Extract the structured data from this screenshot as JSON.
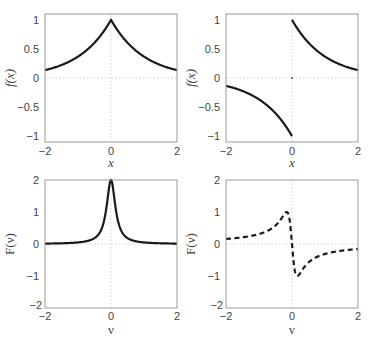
{
  "chart_data": [
    {
      "type": "line",
      "panel": "top-left",
      "title": "",
      "xlabel": "x",
      "ylabel": "f(x)",
      "xlim": [
        -2,
        2
      ],
      "ylim": [
        -1.1,
        1.1
      ],
      "xticks": [
        "-2",
        "0",
        "2"
      ],
      "yticks": [
        "-1",
        "-0.5",
        "0",
        "0.5",
        "1"
      ],
      "grid": "zero lines only (dotted)",
      "series": [
        {
          "name": "f(x) = e^{-|x|}",
          "style": "solid",
          "x": [
            -2,
            -1.5,
            -1,
            -0.5,
            0,
            0.5,
            1,
            1.5,
            2
          ],
          "y": [
            0.135,
            0.223,
            0.368,
            0.607,
            1.0,
            0.607,
            0.368,
            0.223,
            0.135
          ]
        }
      ]
    },
    {
      "type": "line",
      "panel": "top-right",
      "title": "",
      "xlabel": "x",
      "ylabel": "f(x)",
      "xlim": [
        -2,
        2
      ],
      "ylim": [
        -1.1,
        1.1
      ],
      "xticks": [
        "-2",
        "0",
        "2"
      ],
      "yticks": [
        "-1",
        "-0.5",
        "0",
        "0.5",
        "1"
      ],
      "grid": "zero lines only (dotted)",
      "series": [
        {
          "name": "f(x) = sgn(x) e^{-|x|}",
          "style": "solid",
          "x": [
            -2,
            -1.5,
            -1,
            -0.5,
            0,
            0,
            0.5,
            1,
            1.5,
            2
          ],
          "y": [
            -0.135,
            -0.223,
            -0.368,
            -0.607,
            -1.0,
            1.0,
            0.607,
            0.368,
            0.223,
            0.135
          ]
        }
      ]
    },
    {
      "type": "line",
      "panel": "bottom-left",
      "title": "",
      "xlabel": "ν",
      "ylabel": "F(ν)",
      "xlim": [
        -2,
        2
      ],
      "ylim": [
        -2,
        2
      ],
      "xticks": [
        "-2",
        "0",
        "2"
      ],
      "yticks": [
        "-2",
        "-1",
        "0",
        "1",
        "2"
      ],
      "grid": "zero lines only (dotted)",
      "series": [
        {
          "name": "F(ν) = 2/(1+(2πν)^2)",
          "style": "solid",
          "x": [
            -2,
            -1,
            -0.5,
            -0.25,
            -0.1,
            0,
            0.1,
            0.25,
            0.5,
            1,
            2
          ],
          "y": [
            0.0126,
            0.0495,
            0.184,
            0.577,
            1.433,
            2.0,
            1.433,
            0.577,
            0.184,
            0.0495,
            0.0126
          ]
        }
      ]
    },
    {
      "type": "line",
      "panel": "bottom-right",
      "title": "",
      "xlabel": "ν",
      "ylabel": "F(ν)",
      "xlim": [
        -2,
        2
      ],
      "ylim": [
        -2,
        2
      ],
      "xticks": [
        "-2",
        "0",
        "2"
      ],
      "yticks": [
        "-2",
        "-1",
        "0",
        "1",
        "2"
      ],
      "grid": "zero lines only (dotted)",
      "series": [
        {
          "name": "F(ν) = -2(2πν)/(1+(2πν)^2)",
          "style": "dashed",
          "x": [
            -2,
            -1,
            -0.5,
            -0.16,
            0,
            0.16,
            0.5,
            1,
            2
          ],
          "y": [
            0.158,
            0.31,
            0.58,
            1.0,
            0.0,
            -1.0,
            -0.58,
            -0.31,
            -0.158
          ]
        }
      ]
    }
  ],
  "panels": {
    "top_left": {
      "xlabel": "x",
      "ylabel": "f(x)",
      "xticks": [
        "−2",
        "0",
        "2"
      ],
      "yticks": [
        "1",
        "0.5",
        "0",
        "−0.5",
        "−1"
      ]
    },
    "top_right": {
      "xlabel": "x",
      "ylabel": "f(x)",
      "xticks": [
        "−2",
        "0",
        "2"
      ],
      "yticks": [
        "1",
        "0.5",
        "0",
        "−0.5",
        "−1"
      ]
    },
    "bottom_left": {
      "xlabel": "ν",
      "ylabel": "F(ν)",
      "xticks": [
        "−2",
        "0",
        "2"
      ],
      "yticks": [
        "2",
        "1",
        "0",
        "−1",
        "−2"
      ]
    },
    "bottom_right": {
      "xlabel": "ν",
      "ylabel": "F(ν)",
      "xticks": [
        "−2",
        "0",
        "2"
      ],
      "yticks": [
        "2",
        "1",
        "0",
        "−1",
        "−2"
      ]
    }
  },
  "colors": {
    "curve": "#1a1a1a",
    "frame": "#9a9a9a",
    "zero_line": "#c8c8c8",
    "text": "#444444"
  }
}
